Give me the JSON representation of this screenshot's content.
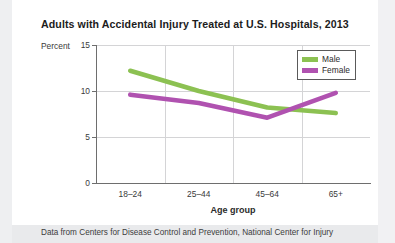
{
  "card": {
    "title": "Adults with Accidental Injury Treated at U.S. Hospitals, 2013",
    "footnote": "Data from Centers for Disease Control and Prevention, National Center for Injury"
  },
  "chart_data": {
    "type": "line",
    "title": "Adults with Accidental Injury Treated at U.S. Hospitals, 2013",
    "categories": [
      "18–24",
      "25–44",
      "45–64",
      "65+"
    ],
    "series": [
      {
        "name": "Male",
        "color": "#8cc152",
        "values": [
          12.2,
          10.0,
          8.2,
          7.6
        ]
      },
      {
        "name": "Female",
        "color": "#b052b0",
        "values": [
          9.6,
          8.7,
          7.1,
          9.8
        ]
      }
    ],
    "xlabel": "Age group",
    "ylabel": "Percent",
    "ylim": [
      0,
      15
    ],
    "yticks": [
      0,
      5,
      10,
      15
    ],
    "ytick_labels": [
      "0",
      "5",
      "10",
      "15"
    ],
    "grid": true,
    "legend_position": "top-right"
  }
}
